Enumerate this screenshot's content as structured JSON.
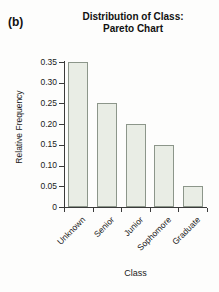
{
  "panel": {
    "label": "(b)"
  },
  "chart_data": {
    "type": "bar",
    "title": "Distribution of Class: Pareto Chart",
    "title_line1": "Distribution of Class:",
    "title_line2": "Pareto Chart",
    "categories": [
      "Unknown",
      "Senior",
      "Junior",
      "Sophomore",
      "Graduate"
    ],
    "values": [
      0.35,
      0.25,
      0.2,
      0.15,
      0.05
    ],
    "xlabel": "Class",
    "ylabel": "Relative Frequency",
    "ylim": [
      0,
      0.35
    ],
    "ytick_labels": [
      "0",
      "0.05",
      "0.10",
      "0.15",
      "0.20",
      "0.25",
      "0.30",
      "0.35"
    ],
    "ytick_values": [
      0,
      0.05,
      0.1,
      0.15,
      0.2,
      0.25,
      0.3,
      0.35
    ],
    "grid": false,
    "legend": false,
    "bar_fill_color": "#e9ede5",
    "bar_stroke_color": "#8c968a",
    "axis_color": "#3a3a3a",
    "background_color": "#fdfdfc",
    "xtick_label_rotation_deg": 45
  }
}
